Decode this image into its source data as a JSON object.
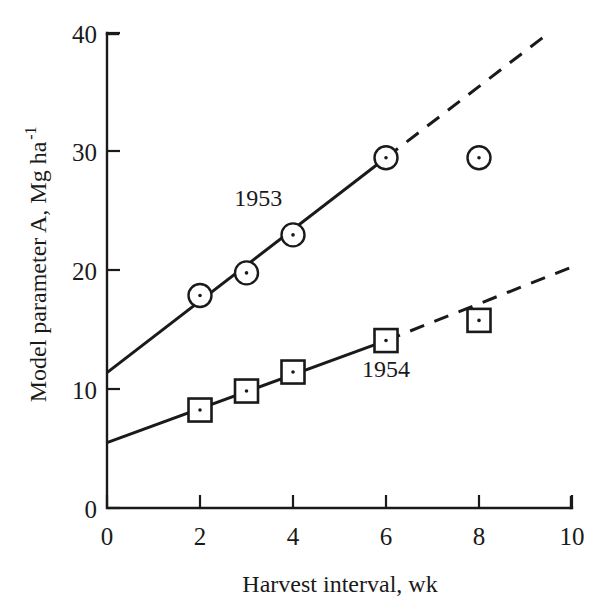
{
  "chart_data": {
    "type": "scatter",
    "title": "",
    "xlabel": "Harvest interval, wk",
    "ylabel": "Model parameter A, Mg ha",
    "ylabel_superscript": "-1",
    "xlim": [
      0,
      10
    ],
    "ylim": [
      0,
      40
    ],
    "xticks": [
      "0",
      "2",
      "4",
      "6",
      "8",
      "10"
    ],
    "xtick_values": [
      0,
      2,
      4,
      6,
      8,
      10
    ],
    "yticks": [
      "0",
      "10",
      "20",
      "30",
      "40"
    ],
    "ytick_values": [
      0,
      10,
      20,
      30,
      40
    ],
    "grid": false,
    "legend": "inline-annotations",
    "series": [
      {
        "name": "1953",
        "marker": "circle-with-center-dot",
        "x": [
          2,
          3,
          4,
          6,
          8
        ],
        "values": [
          17.9,
          19.8,
          23.0,
          29.5,
          29.5
        ],
        "fit_line": {
          "style": "solid",
          "x_start": 0,
          "y_start": 11.4,
          "x_end": 6,
          "y_end": 29.5
        },
        "fit_line_extrapolated": {
          "style": "dashed",
          "x_start": 6,
          "y_start": 29.5,
          "x_end": 9.5,
          "y_end": 40.0
        },
        "annotation": {
          "text": "1953",
          "x": 3.25,
          "y": 25.4
        }
      },
      {
        "name": "1954",
        "marker": "square-with-center-dot",
        "x": [
          2,
          3,
          4,
          6,
          8
        ],
        "values": [
          8.25,
          9.85,
          11.45,
          14.1,
          15.8
        ],
        "fit_line": {
          "style": "solid",
          "x_start": 0,
          "y_start": 5.5,
          "x_end": 6,
          "y_end": 14.1
        },
        "fit_line_extrapolated": {
          "style": "dashed",
          "x_start": 6,
          "y_start": 14.1,
          "x_end": 10,
          "y_end": 20.3
        },
        "annotation": {
          "text": "1954",
          "x": 6.0,
          "y": 11.0
        }
      }
    ]
  },
  "axis": {
    "x_title": "Harvest interval, wk",
    "y_title": "Model parameter A, Mg ha",
    "y_title_exponent": "-1"
  },
  "ticks": {
    "x": [
      "0",
      "2",
      "4",
      "6",
      "8",
      "10"
    ],
    "y": [
      "0",
      "10",
      "20",
      "30",
      "40"
    ]
  },
  "annotations": {
    "series_1": "1953",
    "series_2": "1954"
  },
  "colors": {
    "ink": "#1a1a1a",
    "background": "#ffffff"
  }
}
